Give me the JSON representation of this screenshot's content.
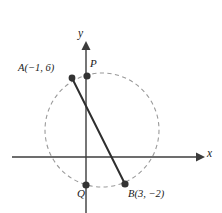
{
  "figure": {
    "kind": "coordinate-geometry-diagram",
    "width": 222,
    "height": 213,
    "background_color": "#ffffff"
  },
  "axes": {
    "x_label": "x",
    "y_label": "y",
    "x_axis_color": "#3c3c3c",
    "y_axis_color": "#3c3c3c",
    "origin_px": {
      "x": 86,
      "y": 157
    }
  },
  "circle": {
    "name": "dashed-circle",
    "center_px": {
      "x": 102,
      "y": 130
    },
    "radius_px": 57,
    "stroke_color": "#9a9a9a",
    "style": "dashed"
  },
  "chord": {
    "name": "segment-AB",
    "from": "A",
    "to": "B",
    "stroke_color": "#2e2e2e"
  },
  "points": [
    {
      "id": "A",
      "label": "A(−1, 6)",
      "label_name": "point-label-a",
      "px": {
        "x": 72,
        "y": 78
      },
      "color": "#333333"
    },
    {
      "id": "P",
      "label": "P",
      "label_name": "point-label-p",
      "px": {
        "x": 87,
        "y": 76
      },
      "color": "#333333"
    },
    {
      "id": "Q",
      "label": "Q",
      "label_name": "point-label-q",
      "px": {
        "x": 86,
        "y": 185
      },
      "color": "#333333"
    },
    {
      "id": "B",
      "label": "B(3, −2)",
      "label_name": "point-label-b",
      "px": {
        "x": 125,
        "y": 184
      },
      "color": "#333333"
    }
  ]
}
